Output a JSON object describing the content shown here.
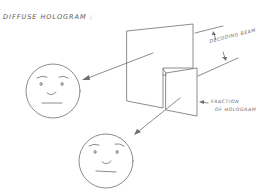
{
  "title": "DIFFUSE HOLOGRAM :",
  "labels": {
    "decoding_beam": "DECODING BEAM",
    "fraction_line1": "FRACTION",
    "fraction_line2": "OF HOLOGRAM"
  },
  "elements": {
    "hologram_plate": "full diffuse hologram plate",
    "fraction_plate": "fraction of hologram plate",
    "face_upper": "reconstructed image from full hologram",
    "face_lower": "reconstructed image from fraction of hologram"
  },
  "colors": {
    "line": "#6e6e6e",
    "text": "#666666"
  }
}
